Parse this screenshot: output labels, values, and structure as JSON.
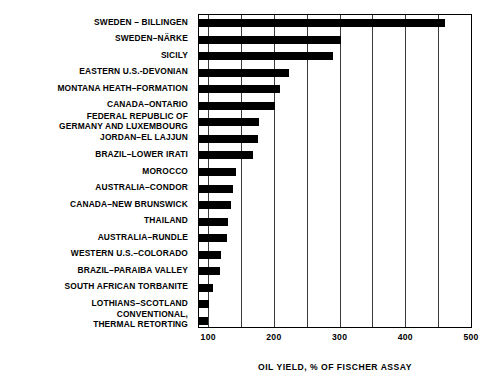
{
  "chart_data": {
    "type": "bar",
    "orientation": "horizontal",
    "title": "",
    "xlabel": "OIL YIELD, % OF FISCHER ASSAY",
    "ylabel": "",
    "xlim": [
      86,
      500
    ],
    "xticks": [
      100,
      200,
      300,
      400,
      500
    ],
    "xtick_labels": [
      "100",
      "200",
      "300",
      "400",
      "500"
    ],
    "gridlines": [
      100,
      150,
      200,
      250,
      300,
      350,
      400,
      450,
      500
    ],
    "grid": true,
    "legend": "none",
    "baseline": 86,
    "bar_color": "#000000",
    "frame_color": "#000000",
    "categories": [
      "SWEDEN – BILLINGEN",
      "SWEDEN–NÄRKE",
      "SICILY",
      "EASTERN U.S.-DEVONIAN",
      "MONTANA  HEATH–FORMATION",
      "CANADA–ONTARIO",
      "FEDERAL  REPUBLIC  OF\nGERMANY  AND  LUXEMBOURG",
      "JORDAN–EL  LAJJUN",
      "BRAZIL–LOWER  IRATI",
      "MOROCCO",
      "AUSTRALIA–CONDOR",
      "CANADA–NEW  BRUNSWICK",
      "THAILAND",
      "AUSTRALIA–RUNDLE",
      "WESTERN U.S.–COLORADO",
      "BRAZIL–PARAIBA  VALLEY",
      "SOUTH  AFRICAN  TORBANITE",
      "LOTHIANS–SCOTLAND",
      "CONVENTIONAL,\nTHERMAL RETORTING"
    ],
    "values": [
      460,
      302,
      290,
      223,
      210,
      202,
      177,
      176,
      168,
      143,
      138,
      134,
      130,
      129,
      120,
      118,
      107,
      101,
      100
    ]
  }
}
